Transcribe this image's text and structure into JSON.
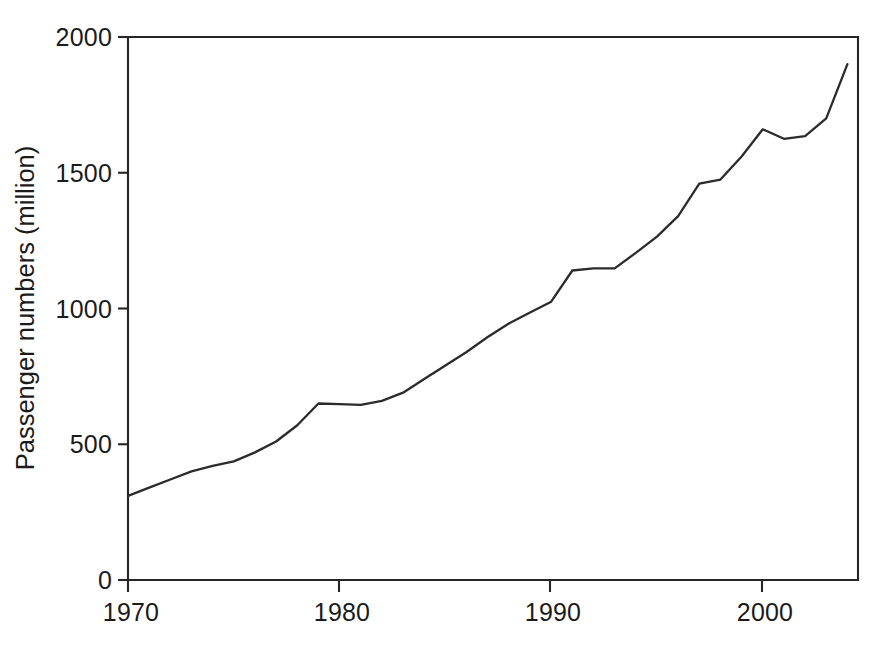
{
  "figure": {
    "background_color": "#ffffff",
    "line_color": "#2b2b2b",
    "axis_color": "#262626",
    "caption_fragment": ""
  },
  "axes": {
    "y_title": "Passenger numbers (million)",
    "x_title": "",
    "y_ticks": [
      "0",
      "500",
      "1000",
      "1500",
      "2000"
    ],
    "x_ticks": [
      "1970",
      "1980",
      "1990",
      "2000"
    ]
  },
  "chart_data": {
    "type": "line",
    "title": "",
    "subtitle": "",
    "xlabel": "",
    "ylabel": "Passenger numbers (million)",
    "xlim": [
      1970,
      2004.5
    ],
    "ylim": [
      0,
      2000
    ],
    "xticks": [
      1970,
      1980,
      1990,
      2000
    ],
    "yticks": [
      0,
      500,
      1000,
      1500,
      2000
    ],
    "grid": false,
    "legend": null,
    "legend_position": "none",
    "markers": false,
    "annotations": [],
    "series": [
      {
        "name": "Passenger numbers",
        "color": "#2b2b2b",
        "x": [
          1970,
          1971,
          1972,
          1973,
          1974,
          1975,
          1976,
          1977,
          1978,
          1979,
          1980,
          1981,
          1982,
          1983,
          1984,
          1985,
          1986,
          1987,
          1988,
          1989,
          1990,
          1991,
          1992,
          1993,
          1994,
          1995,
          1996,
          1997,
          1998,
          1999,
          2000,
          2001,
          2002,
          2003,
          2004
        ],
        "values": [
          310,
          340,
          370,
          400,
          420,
          437,
          470,
          510,
          570,
          650,
          648,
          645,
          660,
          690,
          740,
          790,
          840,
          895,
          945,
          985,
          1025,
          1140,
          1148,
          1148,
          1205,
          1265,
          1340,
          1460,
          1475,
          1560,
          1660,
          1625,
          1635,
          1700,
          1900
        ]
      }
    ]
  }
}
